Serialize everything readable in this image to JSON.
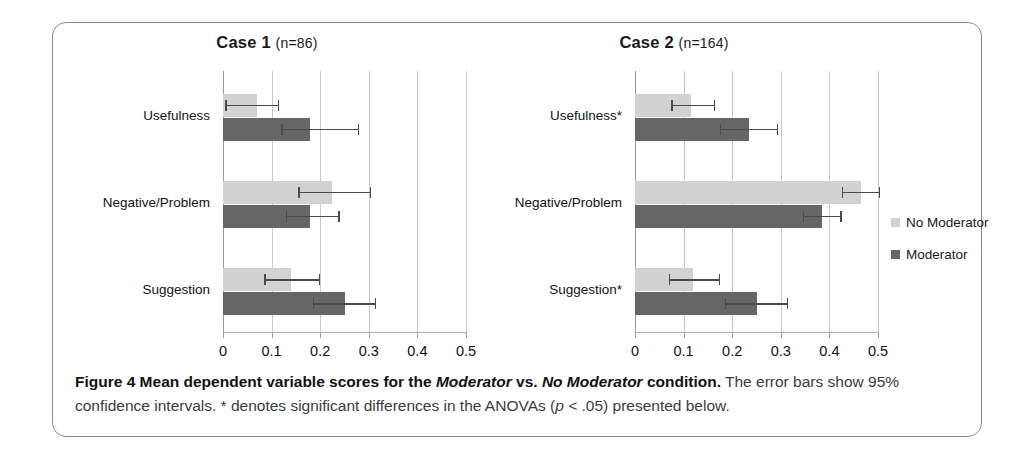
{
  "figure": {
    "caption_label": "Figure 4",
    "caption_bold_1": " Mean dependent variable scores for the ",
    "caption_italic_1": "Moderator",
    "caption_bold_2": " vs. ",
    "caption_italic_2": "No Moderator",
    "caption_bold_3": " condition.",
    "caption_rest_1": " The error bars show 95% confidence intervals. * denotes significant differences in the ANOVAs (",
    "caption_italic_3": "p",
    "caption_rest_2": " < .05) presented below."
  },
  "legend": {
    "items": [
      {
        "label": "No Moderator",
        "color": "#d2d2d2"
      },
      {
        "label": "Moderator",
        "color": "#666666"
      }
    ]
  },
  "colors": {
    "no_moderator": "#d2d2d2",
    "moderator": "#666666",
    "gridline": "#c8c8c8",
    "error_bar": "#4a4a4a",
    "border": "#8a8a8a"
  },
  "chart_data": [
    {
      "type": "bar",
      "orientation": "horizontal",
      "title": "Case 1",
      "subtitle": "(n=86)",
      "n": 86,
      "xlabel": "",
      "ylabel": "",
      "xlim": [
        0,
        0.5
      ],
      "xticks": [
        0,
        0.1,
        0.2,
        0.3,
        0.4,
        0.5
      ],
      "xticklabels": [
        "0",
        "0.1",
        "0.2",
        "0.3",
        "0.4",
        "0.5"
      ],
      "grid": true,
      "legend_position": "none",
      "categories": [
        "Usefulness",
        "Negative/Problem",
        "Suggestion"
      ],
      "series": [
        {
          "name": "No Moderator",
          "color": "#d2d2d2",
          "values": [
            0.07,
            0.225,
            0.14
          ],
          "err_low": [
            0.005,
            0.155,
            0.085
          ],
          "err_high": [
            0.115,
            0.305,
            0.2
          ]
        },
        {
          "name": "Moderator",
          "color": "#666666",
          "values": [
            0.18,
            0.18,
            0.25
          ],
          "err_low": [
            0.12,
            0.13,
            0.185
          ],
          "err_high": [
            0.28,
            0.24,
            0.315
          ]
        }
      ]
    },
    {
      "type": "bar",
      "orientation": "horizontal",
      "title": "Case 2",
      "subtitle": "(n=164)",
      "n": 164,
      "xlabel": "",
      "ylabel": "",
      "xlim": [
        0,
        0.5
      ],
      "xticks": [
        0,
        0.1,
        0.2,
        0.3,
        0.4,
        0.5
      ],
      "xticklabels": [
        "0",
        "0.1",
        "0.2",
        "0.3",
        "0.4",
        "0.5"
      ],
      "grid": true,
      "legend_position": "right",
      "categories": [
        "Usefulness*",
        "Negative/Problem",
        "Suggestion*"
      ],
      "series": [
        {
          "name": "No Moderator",
          "color": "#d2d2d2",
          "values": [
            0.115,
            0.465,
            0.12
          ],
          "err_low": [
            0.075,
            0.425,
            0.07
          ],
          "err_high": [
            0.165,
            0.505,
            0.175
          ]
        },
        {
          "name": "Moderator",
          "color": "#666666",
          "values": [
            0.235,
            0.385,
            0.25
          ],
          "err_low": [
            0.175,
            0.345,
            0.185
          ],
          "err_high": [
            0.295,
            0.425,
            0.315
          ]
        }
      ]
    }
  ]
}
